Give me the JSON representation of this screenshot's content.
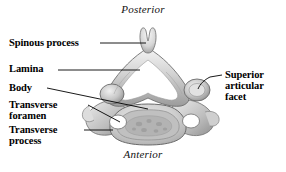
{
  "figure": {
    "background_color": "#ffffff",
    "line_color": "#000000",
    "text_color": "#000000",
    "bone_fill_light": "#f2f2f2",
    "bone_fill_mid": "#c9c9c9",
    "bone_fill_dark": "#8d8d8d",
    "bone_outline": "#6b6b6b"
  },
  "orientation": {
    "posterior": "Posterior",
    "anterior": "Anterior"
  },
  "labels": {
    "spinous_process": "Spinous process",
    "lamina": "Lamina",
    "body": "Body",
    "transverse_foramen": "Transverse\nforamen",
    "transverse_process": "Transverse\nprocess",
    "superior_articular_facet": "Superior\narticular\nfacet"
  }
}
